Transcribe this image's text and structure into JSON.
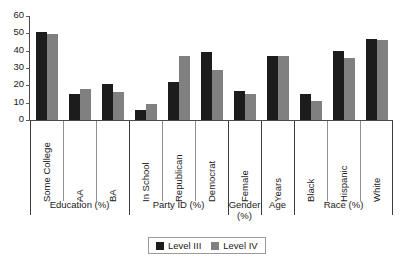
{
  "chart_data": {
    "type": "bar",
    "title": "",
    "xlabel": "",
    "ylabel": "",
    "ylim": [
      0,
      60
    ],
    "yticks": [
      0,
      10,
      20,
      30,
      40,
      50,
      60
    ],
    "grid": false,
    "legend_position": "bottom-center",
    "categories": [
      "Some College",
      "AA",
      "BA",
      "In School",
      "Republican",
      "Democrat",
      "Female",
      "Years",
      "Black",
      "Hispanic",
      "White"
    ],
    "groups": [
      {
        "label": "Education (%)",
        "categories": [
          "Some College",
          "AA",
          "BA"
        ]
      },
      {
        "label": "Party ID (%)",
        "categories": [
          "In School",
          "Republican",
          "Democrat"
        ]
      },
      {
        "label": "Gender (%)",
        "categories": [
          "Female"
        ]
      },
      {
        "label": "Age",
        "categories": [
          "Years"
        ]
      },
      {
        "label": "Race (%)",
        "categories": [
          "Black",
          "Hispanic",
          "White"
        ]
      }
    ],
    "series": [
      {
        "name": "Level III",
        "color": "#1c1c1c",
        "values": [
          51,
          15,
          21,
          6,
          22,
          39,
          17,
          37,
          15,
          40,
          47
        ]
      },
      {
        "name": "Level IV",
        "color": "#808080",
        "values": [
          49.5,
          18,
          16,
          9,
          37,
          29,
          15,
          37,
          11,
          36,
          46
        ]
      }
    ]
  },
  "legend": {
    "entries": [
      {
        "label": "Level III",
        "color": "#1c1c1c"
      },
      {
        "label": "Level IV",
        "color": "#808080"
      }
    ]
  }
}
